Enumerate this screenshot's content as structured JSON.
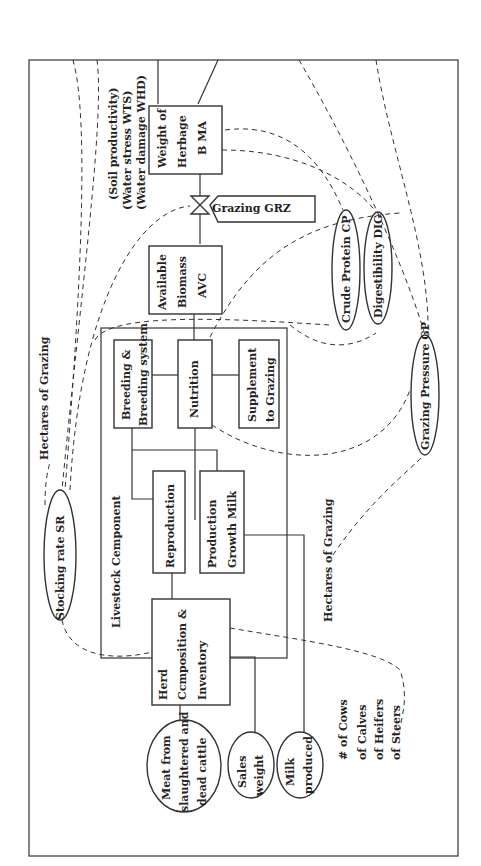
{
  "diagram": {
    "external_inputs": {
      "soil_productivity": "(Soil productivity)",
      "water_stress": "(Water stress WTS)",
      "water_damage": "(Water damage WHD)"
    },
    "stocks": {
      "herbage": [
        "Weight of",
        "Herbage",
        "B MA"
      ],
      "available_biomass": [
        "Available",
        "Biomass",
        "AVC"
      ],
      "herd": [
        "Herd",
        "Ccmposition &",
        "Inventory"
      ]
    },
    "flow": {
      "grazing": "Grazing    GRZ"
    },
    "livestock_component": {
      "title": "Livestock    Cemponent",
      "breeding": [
        "Breeding &",
        "Breeding system"
      ],
      "nutrition": "Nutrition",
      "supplement": [
        "Supplement",
        "to Grazing"
      ],
      "reproduction": "Reproduction",
      "production": [
        "Production",
        "Growth  Milk"
      ]
    },
    "auxiliaries": {
      "stocking_rate": "Stocking   rate  SR",
      "crude_protein": "Crude Protein CP",
      "digestibility": "Digestibility DIG",
      "grazing_pressure": "Grazing  Pressure GP"
    },
    "labels": {
      "hectares_top": "Hectares of  Grazing",
      "hectares_bottom": "Hectares of Grazing",
      "cows": "# of  Cows",
      "calves": "of  Calves",
      "heifers": "of  Heifers",
      "steers": "of  Steers"
    },
    "outputs": {
      "meat": [
        "Meat from",
        "slaughtered and",
        "dead cattle"
      ],
      "sales": [
        "Sales",
        "weight"
      ],
      "milk": [
        "Milk",
        "produced"
      ]
    }
  }
}
